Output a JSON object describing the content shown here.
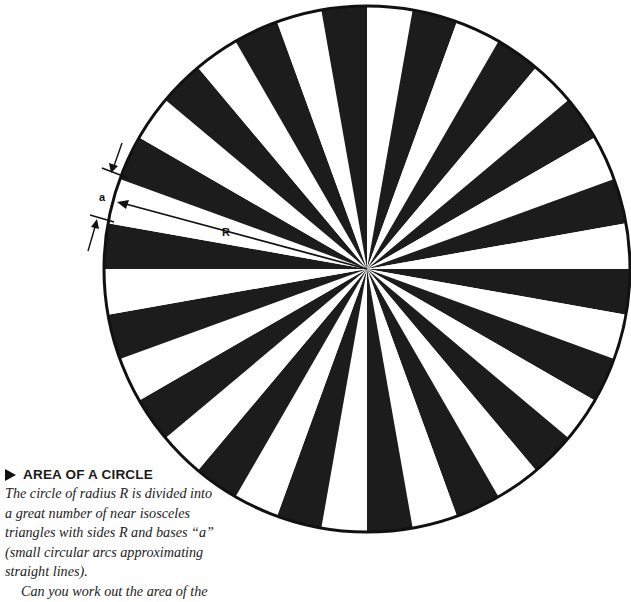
{
  "diagram": {
    "circle": {
      "cx": 367,
      "cy": 269,
      "r": 263,
      "stroke": "#111111",
      "stroke_width": 3
    },
    "sectors": {
      "count": 36,
      "degrees_each": 10,
      "fill_dark": "#1c1c1c",
      "fill_light": "#ffffff",
      "dark_start_deg": 0
    },
    "labels": {
      "radius": "R",
      "arc": "a"
    }
  },
  "caption": {
    "heading_icon": "play-triangle-icon",
    "heading": "AREA OF A CIRCLE",
    "lines": [
      "The circle of radius R is divided into",
      "a great number of near isosceles",
      "triangles with sides R and bases “a”",
      "(small circular arcs approximating",
      "straight lines).",
      "Can you work out the area of the"
    ]
  }
}
